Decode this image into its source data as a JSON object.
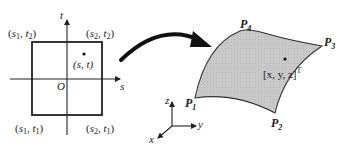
{
  "diagram": {
    "parameter_domain": {
      "axis_s_label": "s",
      "axis_t_label": "t",
      "origin_label": "O",
      "corners": {
        "top_left": {
          "pre": "(",
          "v1": "s",
          "v1_sub": "1",
          "mid": ", ",
          "v2": "t",
          "v2_sub": "2",
          "post": ")"
        },
        "top_right": {
          "pre": "(",
          "v1": "s",
          "v1_sub": "2",
          "mid": ", ",
          "v2": "t",
          "v2_sub": "2",
          "post": ")"
        },
        "bottom_left": {
          "pre": "(",
          "v1": "s",
          "v1_sub": "1",
          "mid": ", ",
          "v2": "t",
          "v2_sub": "1",
          "post": ")"
        },
        "bottom_right": {
          "pre": "(",
          "v1": "s",
          "v1_sub": "2",
          "mid": ", ",
          "v2": "t",
          "v2_sub": "1",
          "post": ")"
        }
      },
      "point_label": "(s, t)"
    },
    "surface": {
      "corner_labels": {
        "p1": {
          "main": "P",
          "sub": "1"
        },
        "p2": {
          "main": "P",
          "sub": "2"
        },
        "p3": {
          "main": "P",
          "sub": "3"
        },
        "p4": {
          "main": "P",
          "sub": "4"
        }
      },
      "point_label": "[x, y, z]",
      "point_label_sup": "T",
      "fill_color": "#c8c8c8",
      "stroke_color": "#333333"
    },
    "world_axes": {
      "x_label": "x",
      "y_label": "y",
      "z_label": "z"
    },
    "colors": {
      "line": "#222222",
      "arrow": "#111111",
      "background": "#ffffff"
    }
  }
}
